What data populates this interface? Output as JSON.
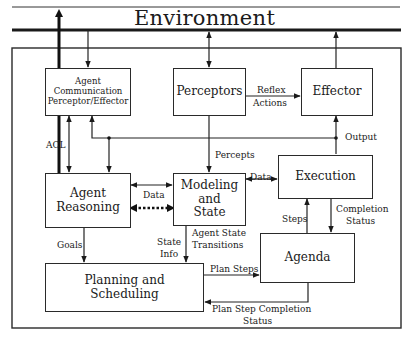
{
  "title": "Environment",
  "boxes": {
    "agent_comm": {
      "line1": "Agent",
      "line2": "Communication",
      "line3": "Perceptor/Effector"
    },
    "perceptors": {
      "label": "Perceptors"
    },
    "effector": {
      "label": "Effector"
    },
    "execution": {
      "label": "Execution"
    },
    "modeling": {
      "line1": "Modeling",
      "line2": "and",
      "line3": "State"
    },
    "reasoning": {
      "line1": "Agent",
      "line2": "Reasoning"
    },
    "agenda": {
      "label": "Agenda"
    },
    "planning": {
      "line1": "Planning and",
      "line2": "Scheduling"
    }
  },
  "edges": {
    "acl": "ACL",
    "reflex_1": "Reflex",
    "reflex_2": "Actions",
    "output": "Output",
    "percepts": "Percepts",
    "data_left": "Data",
    "data_right": "Data",
    "agent_state_1": "Agent State",
    "agent_state_2": "Transitions",
    "state_info_1": "State",
    "state_info_2": "Info",
    "goals": "Goals",
    "steps": "Steps",
    "completion_1": "Completion",
    "completion_2": "Status",
    "plan_steps": "Plan Steps",
    "plan_completion_1": "Plan Step Completion",
    "plan_completion_2": "Status"
  }
}
